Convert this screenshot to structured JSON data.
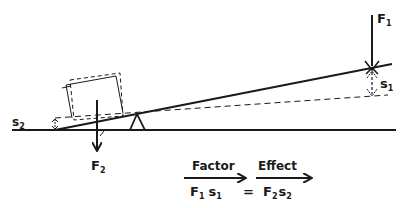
{
  "diagram": {
    "forces": {
      "f1": {
        "label": "F",
        "subscript": "1"
      },
      "f2": {
        "label": "F",
        "subscript": "2"
      }
    },
    "displacements": {
      "s1": {
        "label": "s",
        "subscript": "1"
      },
      "s2": {
        "label": "s",
        "subscript": "2"
      }
    },
    "equation": {
      "factor_label": "Factor",
      "effect_label": "Effect",
      "lhs_f": "F",
      "lhs_f_sub": "1",
      "lhs_s": "s",
      "lhs_s_sub": "1",
      "equals": "=",
      "rhs_f": "F",
      "rhs_f_sub": "2",
      "rhs_s": "s",
      "rhs_s_sub": "2"
    },
    "colors": {
      "ink": "#1a1a1a",
      "background": "#ffffff"
    }
  }
}
